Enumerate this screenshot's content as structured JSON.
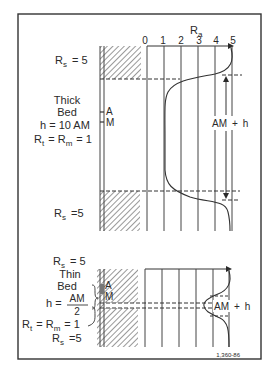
{
  "figure": {
    "id_label": "1,360-86",
    "colors": {
      "ink": "#2a2a2a",
      "frame": "#333333",
      "background": "#ffffff"
    }
  },
  "scale": {
    "title_main": "R",
    "title_sub": "a",
    "ticks": [
      "0",
      "1",
      "2",
      "3",
      "4",
      "5"
    ]
  },
  "thick_bed": {
    "upper_shoulder": {
      "r": "R",
      "sub": "s",
      "eq": "= 5"
    },
    "lower_shoulder": {
      "r": "R",
      "sub": "s",
      "eq": "=5"
    },
    "title_line1": "Thick",
    "title_line2": "Bed",
    "thickness": "h = 10 AM",
    "rt_label": {
      "r1": "R",
      "sub1": "t",
      "mid": "= R",
      "sub2": "m",
      "eq": "= 1"
    },
    "electrode_a": "A",
    "electrode_m": "M",
    "span_label": {
      "left": "AM",
      "plus": "+",
      "right": "h"
    }
  },
  "thin_bed": {
    "upper_shoulder": {
      "r": "R",
      "sub": "s",
      "eq": "= 5"
    },
    "lower_shoulder": {
      "r": "R",
      "sub": "s",
      "eq": "=5"
    },
    "title_line1": "Thin",
    "title_line2": "Bed",
    "thickness_prefix": "h =",
    "thickness_num": "AM",
    "thickness_den": "2",
    "rt_label": {
      "r1": "R",
      "sub1": "t",
      "mid": "= R",
      "sub2": "m",
      "eq": "= 1"
    },
    "electrode_a": "A",
    "electrode_m": "M",
    "span_label": {
      "left": "AM",
      "plus": "+",
      "right": "h"
    }
  }
}
